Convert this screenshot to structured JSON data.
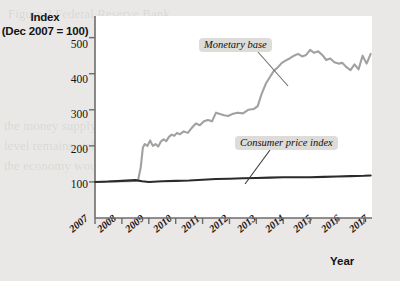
{
  "figure": {
    "background_color": "#e9e8e6",
    "plot_background_color": "#ffffff"
  },
  "axes": {
    "y_title_line1": "Index",
    "y_title_line2": "(Dec 2007 = 100)",
    "x_title": "Year",
    "y_ticks": [
      "500",
      "400",
      "300",
      "200",
      "100"
    ],
    "x_ticks": [
      "2007",
      "2008",
      "2009",
      "2010",
      "2011",
      "2012",
      "2013",
      "2014",
      "2015",
      "2016",
      "2017"
    ]
  },
  "annotations": {
    "monetary_base_label": "Monetary base",
    "cpi_label": "Consumer price index"
  },
  "ghost_text": {
    "line1": "Figure 2  Federal Reserve Bank",
    "line2": "the money supply and Price",
    "line3": "level remains stable over",
    "line4": "the economy would not"
  },
  "chart_data": {
    "type": "line",
    "title": "",
    "subtitle": "",
    "xlabel": "Year",
    "ylabel": "Index (Dec 2007 = 100)",
    "xlim": [
      2007,
      2017.3
    ],
    "ylim": [
      0,
      560
    ],
    "yticks": [
      100,
      200,
      300,
      400,
      500
    ],
    "xticks": [
      2007,
      2008,
      2009,
      2010,
      2011,
      2012,
      2013,
      2014,
      2015,
      2016,
      2017
    ],
    "grid": false,
    "legend": "inline-annotations",
    "colors": {
      "monetary_base": "#a3a19e",
      "consumer_price_index": "#2b2b2b",
      "axis": "#6e6c6a",
      "label_background": "#dedcd9"
    },
    "series": [
      {
        "name": "Monetary base",
        "color": "#a3a19e",
        "x": [
          2007.0,
          2007.25,
          2007.5,
          2007.75,
          2008.0,
          2008.25,
          2008.45,
          2008.6,
          2008.7,
          2008.78,
          2008.85,
          2008.95,
          2009.05,
          2009.15,
          2009.25,
          2009.35,
          2009.45,
          2009.55,
          2009.65,
          2009.75,
          2009.85,
          2009.95,
          2010.05,
          2010.15,
          2010.3,
          2010.45,
          2010.6,
          2010.75,
          2010.9,
          2011.05,
          2011.2,
          2011.35,
          2011.5,
          2011.65,
          2011.8,
          2011.95,
          2012.1,
          2012.3,
          2012.5,
          2012.7,
          2012.9,
          2013.05,
          2013.2,
          2013.35,
          2013.5,
          2013.65,
          2013.8,
          2013.95,
          2014.1,
          2014.25,
          2014.4,
          2014.55,
          2014.7,
          2014.85,
          2015.0,
          2015.15,
          2015.3,
          2015.45,
          2015.6,
          2015.75,
          2015.9,
          2016.05,
          2016.2,
          2016.35,
          2016.5,
          2016.65,
          2016.8,
          2016.95,
          2017.1,
          2017.25
        ],
        "y": [
          100,
          100,
          101,
          101,
          102,
          102,
          103,
          104,
          140,
          195,
          205,
          200,
          215,
          200,
          205,
          198,
          212,
          218,
          213,
          225,
          231,
          228,
          236,
          232,
          240,
          236,
          250,
          262,
          257,
          268,
          272,
          268,
          292,
          288,
          285,
          283,
          288,
          292,
          290,
          300,
          302,
          310,
          345,
          372,
          390,
          408,
          418,
          430,
          437,
          443,
          450,
          455,
          448,
          452,
          466,
          458,
          462,
          452,
          438,
          442,
          432,
          428,
          430,
          418,
          410,
          426,
          412,
          450,
          428,
          455
        ]
      },
      {
        "name": "Consumer price index",
        "color": "#2b2b2b",
        "x": [
          2007.0,
          2007.5,
          2008.0,
          2008.5,
          2008.75,
          2009.0,
          2009.5,
          2010.0,
          2010.5,
          2011.0,
          2011.5,
          2012.0,
          2012.5,
          2013.0,
          2013.5,
          2014.0,
          2014.5,
          2015.0,
          2015.5,
          2016.0,
          2016.5,
          2017.0,
          2017.25
        ],
        "y": [
          100,
          101,
          103,
          105,
          102,
          100,
          102,
          103,
          104,
          106,
          108,
          109,
          110,
          111,
          112,
          113,
          113,
          113,
          114,
          115,
          116,
          117,
          118
        ]
      }
    ]
  }
}
